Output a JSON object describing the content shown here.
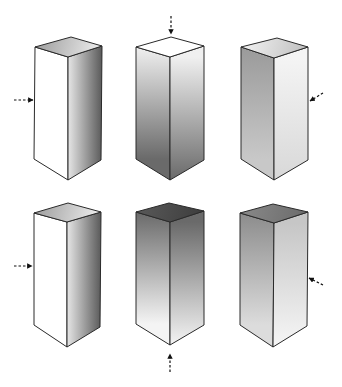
{
  "figure": {
    "width": 342,
    "height": 387,
    "background": "#ffffff",
    "stroke": "#2a2a2a"
  },
  "prisms": [
    {
      "id": "prism-1",
      "row": 1,
      "col": 1,
      "top": {
        "left": [
          35,
          47
        ],
        "back": [
          71,
          37
        ],
        "right": [
          102,
          46
        ],
        "front": [
          68,
          57
        ]
      },
      "bottom": {
        "left": [
          34,
          159
        ],
        "front": [
          68,
          180
        ],
        "right": [
          101,
          160
        ]
      },
      "fills": {
        "top": [
          "#9a9a9a",
          "#f2f2f2"
        ],
        "left": [
          "#ffffff",
          "#ffffff"
        ],
        "right": [
          "#e6e6e6",
          "#5a5a5a"
        ]
      },
      "light_arrow": {
        "from": [
          14,
          100
        ],
        "to": [
          33,
          100
        ],
        "direction": "left"
      }
    },
    {
      "id": "prism-2",
      "row": 1,
      "col": 2,
      "top": {
        "left": [
          136,
          47
        ],
        "back": [
          171,
          37
        ],
        "right": [
          204,
          46
        ],
        "front": [
          170,
          57
        ]
      },
      "bottom": {
        "left": [
          136,
          159
        ],
        "front": [
          170,
          180
        ],
        "right": [
          204,
          160
        ]
      },
      "fills": {
        "top": [
          "#ffffff",
          "#ffffff"
        ],
        "left": [
          "#f0f0f0",
          "#6a6a6a"
        ],
        "right": [
          "#f0f0f0",
          "#6a6a6a"
        ]
      },
      "light_arrow": {
        "from": [
          171,
          16
        ],
        "to": [
          171,
          34
        ],
        "direction": "top"
      }
    },
    {
      "id": "prism-3",
      "row": 1,
      "col": 3,
      "top": {
        "left": [
          241,
          47
        ],
        "back": [
          277,
          38
        ],
        "right": [
          308,
          47
        ],
        "front": [
          274,
          58
        ]
      },
      "bottom": {
        "left": [
          241,
          159
        ],
        "front": [
          274,
          180
        ],
        "right": [
          308,
          160
        ]
      },
      "fills": {
        "top": [
          "#f4f4f4",
          "#bdbdbd"
        ],
        "left": [
          "#9a9a9a",
          "#c8c8c8"
        ],
        "right": [
          "#f4f4f4",
          "#d8d8d8"
        ]
      },
      "light_arrow": {
        "from": [
          323,
          93
        ],
        "to": [
          310,
          101
        ],
        "direction": "upper-right"
      }
    },
    {
      "id": "prism-4",
      "row": 2,
      "col": 1,
      "top": {
        "left": [
          34,
          213
        ],
        "back": [
          68,
          203
        ],
        "right": [
          101,
          212
        ],
        "front": [
          67,
          222
        ]
      },
      "bottom": {
        "left": [
          34,
          325
        ],
        "front": [
          67,
          347
        ],
        "right": [
          100,
          327
        ]
      },
      "fills": {
        "top": [
          "#9a9a9a",
          "#f2f2f2"
        ],
        "left": [
          "#ffffff",
          "#ffffff"
        ],
        "right": [
          "#e6e6e6",
          "#5a5a5a"
        ]
      },
      "light_arrow": {
        "from": [
          14,
          266
        ],
        "to": [
          32,
          266
        ],
        "direction": "left"
      }
    },
    {
      "id": "prism-5",
      "row": 2,
      "col": 2,
      "top": {
        "left": [
          136,
          212
        ],
        "back": [
          169,
          203
        ],
        "right": [
          204,
          211
        ],
        "front": [
          170,
          222
        ]
      },
      "bottom": {
        "left": [
          136,
          324
        ],
        "front": [
          170,
          345
        ],
        "right": [
          204,
          325
        ]
      },
      "fills": {
        "top": [
          "#5a5a5a",
          "#3c3c3c"
        ],
        "left": [
          "#6a6a6a",
          "#f4f4f4"
        ],
        "right": [
          "#6a6a6a",
          "#f4f4f4"
        ]
      },
      "light_arrow": {
        "from": [
          170,
          372
        ],
        "to": [
          170,
          354
        ],
        "direction": "bottom"
      }
    },
    {
      "id": "prism-6",
      "row": 2,
      "col": 3,
      "top": {
        "left": [
          240,
          213
        ],
        "back": [
          273,
          204
        ],
        "right": [
          308,
          212
        ],
        "front": [
          274,
          223
        ]
      },
      "bottom": {
        "left": [
          240,
          325
        ],
        "front": [
          273,
          347
        ],
        "right": [
          307,
          326
        ]
      },
      "fills": {
        "top": [
          "#8a8a8a",
          "#6a6a6a"
        ],
        "left": [
          "#8c8c8c",
          "#dcdcdc"
        ],
        "right": [
          "#c6c6c6",
          "#f6f6f6"
        ]
      },
      "light_arrow": {
        "from": [
          323,
          285
        ],
        "to": [
          309,
          278
        ],
        "direction": "lower-right"
      }
    }
  ]
}
